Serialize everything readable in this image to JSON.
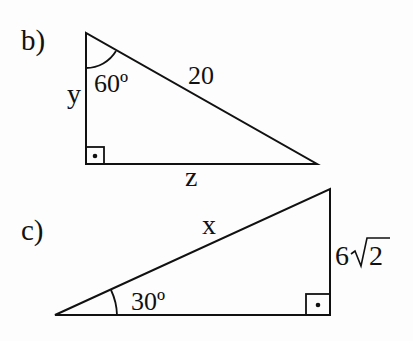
{
  "problems": [
    {
      "id": "b",
      "label": "b)",
      "angle": "60º",
      "hypotenuse": "20",
      "vertical_side": "y",
      "horizontal_side": "z",
      "right_angle_marker": "right-angle-box-with-dot"
    },
    {
      "id": "c",
      "label": "c)",
      "angle": "30º",
      "hypotenuse": "x",
      "vertical_side": "6√2",
      "vertical_side_parts": {
        "coefficient": "6",
        "radical": "√",
        "radicand": "2"
      },
      "right_angle_marker": "right-angle-box-with-dot"
    }
  ],
  "colors": {
    "stroke": "#111111",
    "background": "#fdfdfd"
  }
}
